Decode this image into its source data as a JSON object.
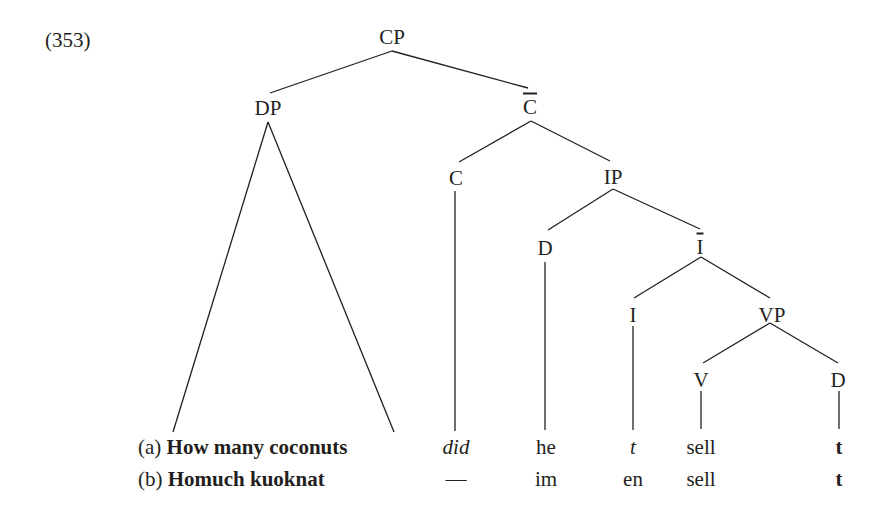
{
  "example_number": "(353)",
  "tree": {
    "nodes": [
      {
        "id": "CP",
        "label": "CP",
        "x": 392,
        "y": 37
      },
      {
        "id": "DP",
        "label": "DP",
        "x": 268,
        "y": 108
      },
      {
        "id": "Cbar",
        "label": "C",
        "bar": true,
        "x": 530,
        "y": 107
      },
      {
        "id": "C",
        "label": "C",
        "x": 456,
        "y": 178
      },
      {
        "id": "IP",
        "label": "IP",
        "x": 613,
        "y": 177
      },
      {
        "id": "D_subj",
        "label": "D",
        "x": 545,
        "y": 248
      },
      {
        "id": "Ibar",
        "label": "I",
        "bar": true,
        "x": 700,
        "y": 247
      },
      {
        "id": "I",
        "label": "I",
        "x": 633,
        "y": 315
      },
      {
        "id": "VP",
        "label": "VP",
        "x": 772,
        "y": 315
      },
      {
        "id": "V",
        "label": "V",
        "x": 701,
        "y": 380
      },
      {
        "id": "D_obj",
        "label": "D",
        "x": 838,
        "y": 380
      }
    ],
    "edges": [
      {
        "from": "CP",
        "to": "DP"
      },
      {
        "from": "CP",
        "to": "Cbar"
      },
      {
        "from": "Cbar",
        "to": "C"
      },
      {
        "from": "Cbar",
        "to": "IP"
      },
      {
        "from": "IP",
        "to": "D_subj"
      },
      {
        "from": "IP",
        "to": "Ibar"
      },
      {
        "from": "Ibar",
        "to": "I"
      },
      {
        "from": "Ibar",
        "to": "VP"
      },
      {
        "from": "VP",
        "to": "V"
      },
      {
        "from": "VP",
        "to": "D_obj"
      }
    ],
    "triangle": {
      "node": "DP",
      "apex": [
        268,
        122
      ],
      "left": [
        173,
        432
      ],
      "right": [
        394,
        432
      ]
    }
  },
  "rows": [
    {
      "label": "(a)",
      "phrase": "How many coconuts",
      "words": [
        {
          "text": "did",
          "style": "italic",
          "x": 456
        },
        {
          "text": "he",
          "style": "normal",
          "x": 546
        },
        {
          "text": "t",
          "style": "italic",
          "x": 633
        },
        {
          "text": "sell",
          "style": "normal",
          "x": 701
        },
        {
          "text": "t",
          "style": "bold",
          "x": 839
        }
      ]
    },
    {
      "label": "(b)",
      "phrase": "Homuch kuoknat",
      "words": [
        {
          "text": "—",
          "style": "normal",
          "x": 456
        },
        {
          "text": "im",
          "style": "normal",
          "x": 546
        },
        {
          "text": "en",
          "style": "normal",
          "x": 633
        },
        {
          "text": "sell",
          "style": "normal",
          "x": 701
        },
        {
          "text": "t",
          "style": "bold",
          "x": 839
        }
      ]
    }
  ],
  "colors": {
    "ink": "#231f20",
    "background": "#ffffff"
  }
}
